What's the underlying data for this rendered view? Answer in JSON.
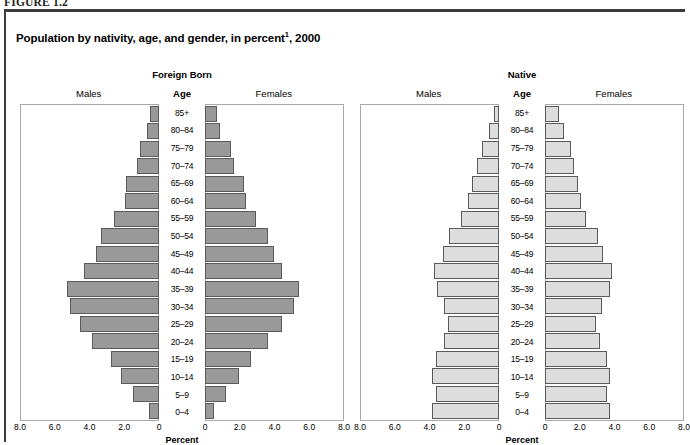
{
  "figure": {
    "label": "FIGURE 1.2",
    "title_main": "Population by nativity, age, and gender, in percent",
    "title_sup": "1",
    "title_tail": ", 2000"
  },
  "axis": {
    "title": "Percent",
    "tick_labels": [
      "8.0",
      "6.0",
      "4.0",
      "2.0",
      "0"
    ],
    "tick_values": [
      8.0,
      6.0,
      4.0,
      2.0,
      0
    ],
    "max": 8.0
  },
  "labels": {
    "males": "Males",
    "females": "Females",
    "age": "Age"
  },
  "panels": [
    {
      "key": "foreign_born",
      "heading": "Foreign Born",
      "fill": "#999999"
    },
    {
      "key": "native",
      "heading": "Native",
      "fill": "#dddddd"
    }
  ],
  "chart_data": {
    "type": "bar",
    "subtype": "population-pyramid",
    "xlabel": "Percent",
    "ylabel": "Age",
    "xlim": [
      0,
      8.0
    ],
    "xticks": [
      8.0,
      6.0,
      4.0,
      2.0,
      0
    ],
    "grid": false,
    "legend": "none",
    "age_groups": [
      "85+",
      "80–84",
      "75–79",
      "70–74",
      "65–69",
      "60–64",
      "55–59",
      "50–54",
      "45–49",
      "40–44",
      "35–39",
      "30–34",
      "25–29",
      "20–24",
      "15–19",
      "10–14",
      "5–9",
      "0–4"
    ],
    "panels": [
      {
        "name": "Foreign Born",
        "series": [
          {
            "name": "Males",
            "values": [
              0.5,
              0.7,
              1.1,
              1.3,
              1.9,
              2.0,
              2.6,
              3.4,
              3.7,
              4.4,
              5.4,
              5.2,
              4.6,
              3.9,
              2.8,
              2.2,
              1.5,
              0.6
            ]
          },
          {
            "name": "Females",
            "values": [
              0.7,
              0.9,
              1.5,
              1.7,
              2.3,
              2.4,
              3.0,
              3.7,
              4.0,
              4.5,
              5.5,
              5.2,
              4.5,
              3.7,
              2.7,
              2.0,
              1.2,
              0.5
            ]
          }
        ]
      },
      {
        "name": "Native",
        "series": [
          {
            "name": "Males",
            "values": [
              0.3,
              0.6,
              1.0,
              1.3,
              1.6,
              1.8,
              2.2,
              2.9,
              3.3,
              3.8,
              3.6,
              3.2,
              3.0,
              3.2,
              3.7,
              3.9,
              3.7,
              3.9
            ]
          },
          {
            "name": "Females",
            "values": [
              0.8,
              1.1,
              1.5,
              1.7,
              1.9,
              2.1,
              2.4,
              3.1,
              3.4,
              3.9,
              3.8,
              3.3,
              3.0,
              3.2,
              3.6,
              3.8,
              3.6,
              3.8
            ]
          }
        ]
      }
    ]
  }
}
